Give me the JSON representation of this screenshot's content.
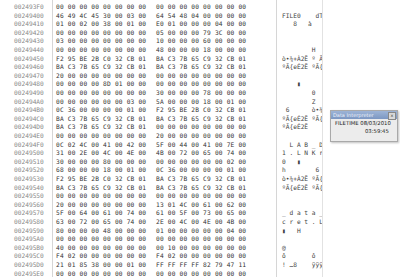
{
  "hex_view": {
    "rows": [
      {
        "addr": "002493F0",
        "a": "00 00 00 00 00 00 00 00",
        "b": "00 00 00 00 00 00 00 00",
        "ascii": ""
      },
      {
        "addr": "00249400",
        "a": "46 49 4C 45 30 00 03 00",
        "b": "64 54 48 04 00 00 00 00",
        "ascii": "FILE0    dTH"
      },
      {
        "addr": "00249410",
        "a": "01 00 02 00 38 00 01 00",
        "b": "E0 01 00 00 00 04 00 00",
        "ascii": "   8   à"
      },
      {
        "addr": "00249420",
        "a": "00 00 00 00 00 00 00 00",
        "b": "05 00 00 00 79 3C 00 00",
        "ascii": "            y<"
      },
      {
        "addr": "00249430",
        "a": "03 00 00 00 00 00 00 00",
        "b": "10 00 00 00 60 00 00 00",
        "ascii": "            `"
      },
      {
        "addr": "00249440",
        "a": "00 00 00 00 00 00 00 00",
        "b": "48 00 00 00 18 00 00 00",
        "ascii": "        H"
      },
      {
        "addr": "00249450",
        "a": "F2 95 BE 2B C0 32 CB 01",
        "b": "BA C3 7B 65 C9 32 CB 01",
        "ascii": "ò•¾+À2Ë º Ã{eÉ2Ë"
      },
      {
        "addr": "00249460",
        "a": "BA C3 7B 65 C9 32 CB 01",
        "b": "BA C3 7B 65 C9 32 CB 01",
        "ascii": "ºÃ{eÉ2Ë ºÃ{eÉ2Ë"
      },
      {
        "addr": "00249470",
        "a": "20 00 00 00 00 00 00 00",
        "b": "00 00 00 00 00 00 00 00",
        "ascii": ""
      },
      {
        "addr": "00249480",
        "a": "00 00 00 00 8D 01 00 00",
        "b": "00 00 00 00 00 00 00 00",
        "ascii": "    ▮"
      },
      {
        "addr": "00249490",
        "a": "00 00 00 00 00 00 00 00",
        "b": "30 00 00 00 78 00 00 00",
        "ascii": "        0   x"
      },
      {
        "addr": "002494A0",
        "a": "00 00 00 00 00 00 03 00",
        "b": "5A 00 00 00 18 00 01 00",
        "ascii": "        Z"
      },
      {
        "addr": "002494B0",
        "a": "0C 36 00 00 00 00 01 00",
        "b": "F2 95 BE 2B C0 32 CB 01",
        "ascii": " 6      ò•¾+À2Ë"
      },
      {
        "addr": "002494C0",
        "a": "BA C3 7B 65 C9 32 CB 01",
        "b": "BA C3 7B 65 C9 32 CB 01",
        "ascii": "ºÃ{eÉ2Ë ºÃ{eÉ2Ë"
      },
      {
        "addr": "002494D0",
        "a": "BA C3 7B 65 C9 32 CB 01",
        "b": "00 00 00 00 00 00 00 00",
        "ascii": "ºÃ{eÉ2Ë"
      },
      {
        "addr": "002494E0",
        "a": "00 00 00 00 00 00 00 00",
        "b": "20 00 00 00 00 00 00 00",
        "ascii": ""
      },
      {
        "addr": "002494F0",
        "a": "0C 02 4C 00 41 00 42 00",
        "b": "5F 00 44 00 41 00 7E 00",
        "ascii": "  L A B _ D A ~"
      },
      {
        "addr": "00249500",
        "a": "31 00 2E 00 4C 00 4E 00",
        "b": "4B 00 72 00 65 00 74 00",
        "ascii": "1 . L N K r e t"
      },
      {
        "addr": "00249510",
        "a": "30 00 00 00 80 00 00 00",
        "b": "00 00 00 00 00 00 02 00",
        "ascii": "0   ▮"
      },
      {
        "addr": "00249520",
        "a": "68 00 00 00 18 00 01 00",
        "b": "0C 36 00 00 00 00 01 00",
        "ascii": "h        6"
      },
      {
        "addr": "00249530",
        "a": "F2 95 BE 2B C0 32 CB 01",
        "b": "BA C3 7B 65 C9 32 CB 01",
        "ascii": "ò•¾+À2Ë ºÃ{eÉ2Ë"
      },
      {
        "addr": "00249540",
        "a": "BA C3 7B 65 C9 32 CB 01",
        "b": "BA C3 7B 65 C9 32 CB 01",
        "ascii": "ºÃ{eÉ2Ë ºÃ{eÉ2Ë"
      },
      {
        "addr": "00249550",
        "a": "00 00 00 00 00 00 00 00",
        "b": "00 00 00 00 00 00 00 00",
        "ascii": ""
      },
      {
        "addr": "00249560",
        "a": "20 00 00 00 00 00 00 00",
        "b": "13 01 4C 00 61 00 62 00",
        "ascii": "           L a b"
      },
      {
        "addr": "00249570",
        "a": "5F 00 64 00 61 00 74 00",
        "b": "61 00 5F 00 73 00 65 00",
        "ascii": "_ d a t a _ s e"
      },
      {
        "addr": "00249580",
        "a": "63 00 72 00 65 00 74 00",
        "b": "2E 00 4C 00 4E 00 4B 00",
        "ascii": "c r e t . L N K"
      },
      {
        "addr": "00249590",
        "a": "80 00 00 00 48 00 00 00",
        "b": "01 00 00 00 00 00 04 00",
        "ascii": "▮   H"
      },
      {
        "addr": "002495A0",
        "a": "00 00 00 00 00 00 00 00",
        "b": "00 00 00 00 00 00 00 00",
        "ascii": ""
      },
      {
        "addr": "002495B0",
        "a": "40 00 00 00 00 00 00 00",
        "b": "00 10 00 00 00 00 00 00",
        "ascii": "@"
      },
      {
        "addr": "002495C0",
        "a": "F4 02 00 00 00 00 00 00",
        "b": "F4 02 00 00 00 00 00 00",
        "ascii": "ô       ô"
      },
      {
        "addr": "002495D0",
        "a": "21 01 85 38 00 00 01 00",
        "b": "FF FF FF FF 82 79 47 11",
        "ascii": "! …8    ÿÿÿÿ‚yG"
      },
      {
        "addr": "002495E0",
        "a": "00 00 00 00 00 00 00 00",
        "b": "00 00 00 00 00 00 00 00",
        "ascii": ""
      }
    ]
  },
  "info_panel": {
    "title": "Data Interpreter",
    "close_icon": "×",
    "label": "FILETIME",
    "date": "08/03/2010",
    "time": "03:59:45"
  }
}
